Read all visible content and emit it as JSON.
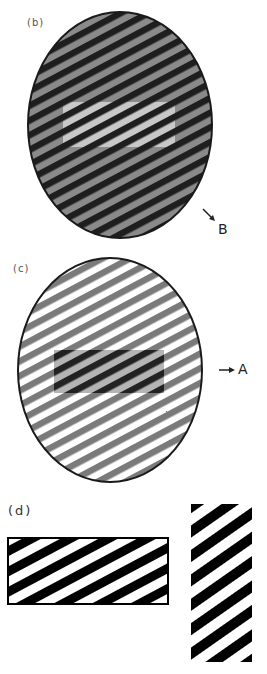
{
  "figure": {
    "panels": [
      {
        "id": "b",
        "label": "(b)",
        "description": "Ellipse filled with dark/medium-gray diagonal stripes; central rectangle with light-gray/dark stripes",
        "ellipse": {
          "cx": 120,
          "cy": 125,
          "rx": 92,
          "ry": 113
        },
        "outer_stripes": {
          "dark": "#1e1e1e",
          "light": "#8a8a8a"
        },
        "inner_rect": {
          "x": 63,
          "y": 102,
          "w": 112,
          "h": 45,
          "dark": "#1e1e1e",
          "light": "#c8c8c8"
        },
        "marker": {
          "text": "B",
          "arrow": "↘"
        }
      },
      {
        "id": "c",
        "label": "(c)",
        "description": "Ellipse filled with medium-gray/white diagonal stripes; central rectangle with dark/light-gray stripes",
        "ellipse": {
          "cx": 110,
          "cy": 370,
          "rx": 92,
          "ry": 112
        },
        "outer_stripes": {
          "dark": "#7a7a7a",
          "light": "#ffffff"
        },
        "inner_rect": {
          "x": 54,
          "y": 350,
          "w": 110,
          "h": 43,
          "dark": "#222222",
          "light": "#b4b4b4"
        },
        "marker": {
          "text": "A",
          "arrow": "→"
        }
      },
      {
        "id": "d",
        "label": "(d)",
        "description": "Horizontal rectangle and vertical rectangle with black/white diagonal stripes",
        "rect_horizontal": {
          "x": 7,
          "y": 537,
          "w": 162,
          "h": 68
        },
        "rect_vertical": {
          "x": 190,
          "y": 503,
          "w": 63,
          "h": 160
        },
        "stripes": {
          "dark": "#000000",
          "light": "#ffffff"
        }
      }
    ]
  }
}
